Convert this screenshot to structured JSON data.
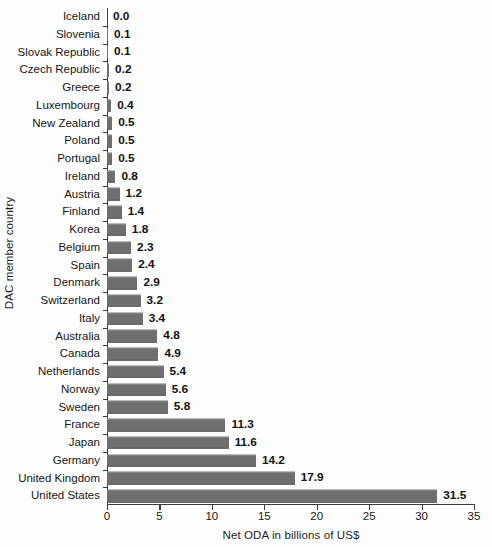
{
  "chart_data": {
    "type": "bar",
    "orientation": "horizontal",
    "title": "",
    "xlabel": "Net ODA in billions of US$",
    "ylabel": "DAC member country",
    "xlim": [
      0,
      35
    ],
    "xticks": [
      0,
      5,
      10,
      15,
      20,
      25,
      30,
      35
    ],
    "xtick_labels": [
      "0",
      "5",
      "10",
      "15",
      "20",
      "25",
      "30",
      "35"
    ],
    "grid": false,
    "legend": null,
    "bar_color": "#6f6f6f",
    "axis_color": "#3b3b3b",
    "background_color": "#fdfdfd",
    "value_label_format": "one-decimal",
    "categories": [
      "Iceland",
      "Slovenia",
      "Slovak Republic",
      "Czech Republic",
      "Greece",
      "Luxembourg",
      "New Zealand",
      "Poland",
      "Portugal",
      "Ireland",
      "Austria",
      "Finland",
      "Korea",
      "Belgium",
      "Spain",
      "Denmark",
      "Switzerland",
      "Italy",
      "Australia",
      "Canada",
      "Netherlands",
      "Norway",
      "Sweden",
      "France",
      "Japan",
      "Germany",
      "United Kingdom",
      "United States"
    ],
    "values": [
      0.0,
      0.1,
      0.1,
      0.2,
      0.2,
      0.4,
      0.5,
      0.5,
      0.5,
      0.8,
      1.2,
      1.4,
      1.8,
      2.3,
      2.4,
      2.9,
      3.2,
      3.4,
      4.8,
      4.9,
      5.4,
      5.6,
      5.8,
      11.3,
      11.6,
      14.2,
      17.9,
      31.5
    ],
    "value_labels": [
      "0.0",
      "0.1",
      "0.1",
      "0.2",
      "0.2",
      "0.4",
      "0.5",
      "0.5",
      "0.5",
      "0.8",
      "1.2",
      "1.4",
      "1.8",
      "2.3",
      "2.4",
      "2.9",
      "3.2",
      "3.4",
      "4.8",
      "4.9",
      "5.4",
      "5.6",
      "5.8",
      "11.3",
      "11.6",
      "14.2",
      "17.9",
      "31.5"
    ]
  }
}
